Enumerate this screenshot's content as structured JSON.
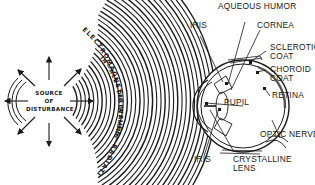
{
  "diagram": {
    "source": {
      "line1": "SOURCE",
      "line2": "OF",
      "line3": "DISTURBANCE"
    },
    "wave_text": {
      "outer": "ELECTROMAGNETIC WAVES—RADIATING",
      "inner": "IN—ALL—DIRECTIONS"
    },
    "eye_labels": {
      "aqueous_humor": "AQUEOUS HUMOR",
      "cornea": "CORNEA",
      "iris_top": "IRIS",
      "sclerotic_1": "SCLEROTIC",
      "sclerotic_2": "COAT",
      "choroid_1": "CHOROID",
      "choroid_2": "COAT",
      "retina": "RETINA",
      "pupil": "PUPIL",
      "optic_nerve": "OPTIC NERVE",
      "iris_bottom": "IRIS",
      "lens_1": "CRYSTALLINE",
      "lens_2": "LENS"
    },
    "colors": {
      "ink": "#1a1a1a",
      "background": "#ffffff"
    }
  }
}
